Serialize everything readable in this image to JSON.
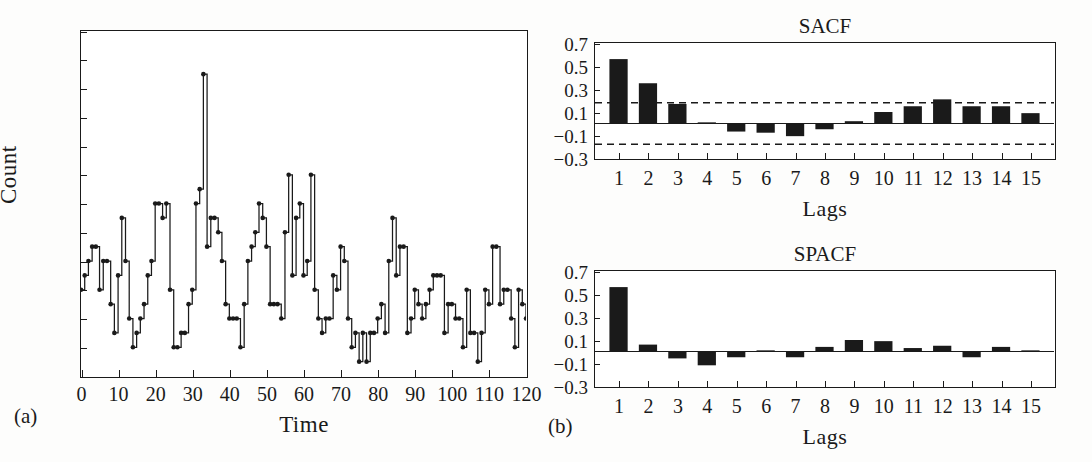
{
  "figure": {
    "background": "#fdfdfc",
    "ink": "#1a1a1a",
    "bar_fill": "#1a1a1a"
  },
  "panel_a": {
    "label": "(a)",
    "xlabel": "Time",
    "ylabel": "Count",
    "xticks": [
      "0",
      "10",
      "20",
      "30",
      "40",
      "50",
      "60",
      "70",
      "80",
      "90",
      "100",
      "110",
      "120"
    ],
    "yticks": [
      "0",
      "2",
      "4",
      "6",
      "8",
      "10",
      "12",
      "14",
      "16",
      "18",
      "20",
      "22",
      "24"
    ]
  },
  "panel_b": {
    "label": "(b)",
    "sacf_title": "SACF",
    "spacf_title": "SPACF",
    "xlabel": "Lags",
    "xticks": [
      "1",
      "2",
      "3",
      "4",
      "5",
      "6",
      "7",
      "8",
      "9",
      "10",
      "11",
      "12",
      "13",
      "14",
      "15"
    ],
    "yticks": [
      "0.7",
      "0.5",
      "0.3",
      "0.1",
      "−0.1",
      "−0.3"
    ]
  },
  "chart_data": [
    {
      "type": "line",
      "title": "",
      "panel": "(a)",
      "xlabel": "Time",
      "ylabel": "Count",
      "xlim": [
        0,
        120
      ],
      "ylim": [
        0,
        24
      ],
      "xticks": [
        0,
        10,
        20,
        30,
        40,
        50,
        60,
        70,
        80,
        90,
        100,
        110,
        120
      ],
      "yticks": [
        0,
        2,
        4,
        6,
        8,
        10,
        12,
        14,
        16,
        18,
        20,
        22,
        24
      ],
      "grid": false,
      "legend": "none",
      "style": "step-post with filled circle markers",
      "x": [
        0,
        1,
        2,
        3,
        4,
        5,
        6,
        7,
        8,
        9,
        10,
        11,
        12,
        13,
        14,
        15,
        16,
        17,
        18,
        19,
        20,
        21,
        22,
        23,
        24,
        25,
        26,
        27,
        28,
        29,
        30,
        31,
        32,
        33,
        34,
        35,
        36,
        37,
        38,
        39,
        40,
        41,
        42,
        43,
        44,
        45,
        46,
        47,
        48,
        49,
        50,
        51,
        52,
        53,
        54,
        55,
        56,
        57,
        58,
        59,
        60,
        61,
        62,
        63,
        64,
        65,
        66,
        67,
        68,
        69,
        70,
        71,
        72,
        73,
        74,
        75,
        76,
        77,
        78,
        79,
        80,
        81,
        82,
        83,
        84,
        85,
        86,
        87,
        88,
        89,
        90,
        91,
        92,
        93,
        94,
        95,
        96,
        97,
        98,
        99,
        100,
        101,
        102,
        103,
        104,
        105,
        106,
        107,
        108,
        109,
        110,
        111,
        112,
        113,
        114,
        115,
        116,
        117,
        118,
        119,
        120
      ],
      "values": [
        6,
        7,
        8,
        9,
        9,
        6,
        8,
        8,
        5,
        3,
        7,
        11,
        8,
        4,
        2,
        3,
        4,
        5,
        7,
        8,
        12,
        12,
        11,
        12,
        6,
        2,
        2,
        3,
        3,
        5,
        6,
        12,
        13,
        21,
        9,
        11,
        11,
        10,
        8,
        5,
        4,
        4,
        4,
        2,
        5,
        8,
        9,
        10,
        12,
        11,
        9,
        5,
        5,
        5,
        4,
        10,
        14,
        7,
        11,
        12,
        7,
        8,
        14,
        6,
        4,
        3,
        4,
        4,
        7,
        6,
        9,
        8,
        4,
        2,
        3,
        1,
        3,
        1,
        3,
        3,
        4,
        5,
        3,
        8,
        11,
        7,
        9,
        9,
        3,
        4,
        6,
        5,
        4,
        5,
        6,
        7,
        7,
        7,
        3,
        5,
        5,
        4,
        4,
        2,
        6,
        3,
        3,
        1,
        3,
        6,
        5,
        9,
        9,
        5,
        6,
        6,
        4,
        2,
        6,
        5,
        4,
        2,
        3,
        2,
        2,
        2,
        9
      ]
    },
    {
      "type": "bar",
      "title": "SACF",
      "panel": "(b) top",
      "xlabel": "Lags",
      "ylabel": "",
      "categories": [
        1,
        2,
        3,
        4,
        5,
        6,
        7,
        8,
        9,
        10,
        11,
        12,
        13,
        14,
        15
      ],
      "values": [
        0.56,
        0.35,
        0.17,
        0.01,
        -0.07,
        -0.08,
        -0.11,
        -0.05,
        0.02,
        0.1,
        0.15,
        0.21,
        0.15,
        0.15,
        0.09
      ],
      "ylim": [
        -0.3,
        0.7
      ],
      "yticks": [
        0.7,
        0.5,
        0.3,
        0.1,
        -0.1,
        -0.3
      ],
      "grid": false,
      "legend": "none",
      "reference_lines": [
        {
          "value": 0.0,
          "style": "solid"
        },
        {
          "value": 0.18,
          "style": "dashed"
        },
        {
          "value": -0.18,
          "style": "dashed"
        }
      ]
    },
    {
      "type": "bar",
      "title": "SPACF",
      "panel": "(b) bottom",
      "xlabel": "Lags",
      "ylabel": "",
      "categories": [
        1,
        2,
        3,
        4,
        5,
        6,
        7,
        8,
        9,
        10,
        11,
        12,
        13,
        14,
        15
      ],
      "values": [
        0.56,
        0.06,
        -0.06,
        -0.12,
        -0.05,
        0.01,
        -0.05,
        0.04,
        0.1,
        0.09,
        0.03,
        0.05,
        -0.05,
        0.04,
        0.01
      ],
      "ylim": [
        -0.3,
        0.7
      ],
      "yticks": [
        0.7,
        0.5,
        0.3,
        0.1,
        -0.1,
        -0.3
      ],
      "grid": false,
      "legend": "none",
      "reference_lines": [
        {
          "value": 0.0,
          "style": "solid"
        }
      ]
    }
  ]
}
